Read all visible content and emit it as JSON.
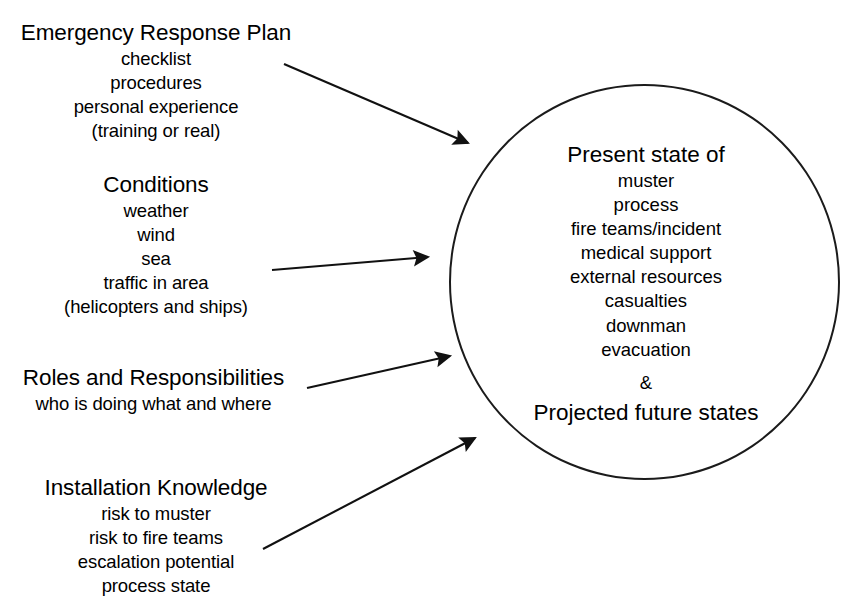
{
  "diagram": {
    "background_color": "#ffffff",
    "stroke_color": "#1b1b1b",
    "sources": [
      {
        "id": "emergency-response-plan",
        "heading": "Emergency Response Plan",
        "lines": [
          "checklist",
          "procedures",
          "personal experience",
          "(training or real)"
        ]
      },
      {
        "id": "conditions",
        "heading": "Conditions",
        "lines": [
          "weather",
          "wind",
          "sea",
          "traffic in area",
          "(helicopters and ships)"
        ]
      },
      {
        "id": "roles-and-responsibilities",
        "heading": "Roles and Responsibilities",
        "lines": [
          "who is doing what and where"
        ]
      },
      {
        "id": "installation-knowledge",
        "heading": "Installation Knowledge",
        "lines": [
          "risk to muster",
          "risk to fire teams",
          "escalation potential",
          "process state"
        ]
      }
    ],
    "circle": {
      "title": "Present state of",
      "items": [
        "muster",
        "process",
        "fire teams/incident",
        "medical support",
        "external resources",
        "casualties",
        "downman",
        "evacuation"
      ],
      "conjunction": "&",
      "footer": "Projected future states"
    },
    "arrows": [
      {
        "id": "arrow-erp",
        "from": [
          284,
          64
        ],
        "to": [
          474,
          146
        ]
      },
      {
        "id": "arrow-conditions",
        "from": [
          272,
          270
        ],
        "to": [
          434,
          257
        ]
      },
      {
        "id": "arrow-roles",
        "from": [
          307,
          388
        ],
        "to": [
          456,
          355
        ]
      },
      {
        "id": "arrow-install",
        "from": [
          263,
          549
        ],
        "to": [
          481,
          434
        ]
      }
    ]
  }
}
